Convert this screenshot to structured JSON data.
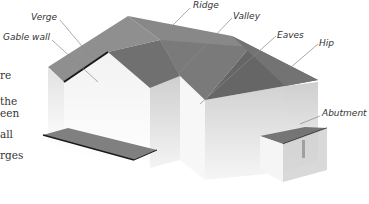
{
  "figure": {
    "type": "roof-anatomy-diagram",
    "labels": {
      "verge": "Verge",
      "gable_wall": "Gable wall",
      "ridge": "Ridge",
      "valley": "Valley",
      "eaves": "Eaves",
      "hip": "Hip",
      "abutment": "Abutment"
    },
    "colors": {
      "roof_light": "#8c8c8c",
      "roof_dark": "#6e6e6e",
      "roof_mid": "#7d7d7d",
      "wall_light": "#ececec",
      "wall_mid": "#d6d6d6",
      "wall_shade": "#c4c4c4",
      "edge_dark": "#1a1a1a",
      "leader_line": "#888888"
    }
  },
  "cropped_body_text": {
    "line1": "re",
    "line2": "the",
    "line3": "een",
    "line4": "all",
    "line5": "rges"
  }
}
